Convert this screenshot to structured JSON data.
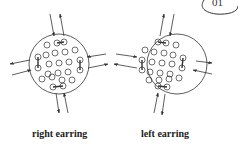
{
  "badge": {
    "text": "01"
  },
  "diagrams": [
    {
      "label": "right earring",
      "cx": 59,
      "cy": 64
    },
    {
      "label": "left earring",
      "cx": 177,
      "cy": 64
    }
  ],
  "colors": {
    "stroke": "#333333",
    "background": "#ffffff"
  }
}
